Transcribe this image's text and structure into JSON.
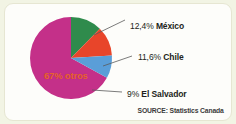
{
  "figure": {
    "frame_color": "#f2f4e4",
    "panel_color": "#fdfdfa",
    "source_note": "SOURCE: Statistics Canada"
  },
  "chart_data": {
    "type": "pie",
    "title": "",
    "subtitle": "",
    "xlabel": "",
    "ylabel": "",
    "grid": false,
    "legend_position": "callout-labels",
    "annotations": [
      "SOURCE: Statistics Canada"
    ],
    "categories": [
      "México",
      "Chile",
      "El Salvador",
      "otros"
    ],
    "values": [
      12.4,
      11.6,
      9,
      67
    ],
    "value_labels": [
      "12,4%",
      "11,6%",
      "9%",
      "67%"
    ],
    "colors": [
      "#2f8b4c",
      "#e8452a",
      "#5a9ed8",
      "#c43089"
    ],
    "slices": [
      {
        "name": "México",
        "value": 12.4,
        "value_label": "12,4%",
        "full_label": "12,4% México",
        "color": "#2f8b4c",
        "label_placement": "outside-right-top"
      },
      {
        "name": "Chile",
        "value": 11.6,
        "value_label": "11,6%",
        "full_label": "11,6% Chile",
        "color": "#e8452a",
        "label_placement": "outside-right-middle"
      },
      {
        "name": "El Salvador",
        "value": 9,
        "value_label": "9%",
        "full_label": "9% El Salvador",
        "color": "#5a9ed8",
        "label_placement": "outside-right-bottom"
      },
      {
        "name": "otros",
        "value": 67,
        "value_label": "67%",
        "full_label": "67% otros",
        "color": "#c43089",
        "label_placement": "inside"
      }
    ]
  }
}
